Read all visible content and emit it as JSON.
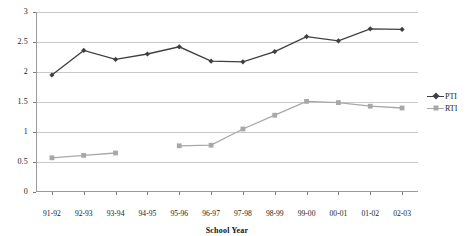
{
  "chart_data": {
    "type": "line",
    "title": "",
    "xlabel": "School Year",
    "ylabel": "",
    "categories": [
      "91-92",
      "92-93",
      "93-94",
      "94-95",
      "95-96",
      "96-97",
      "97-98",
      "98-99",
      "99-00",
      "00-01",
      "01-02",
      "02-03"
    ],
    "ylim": [
      0,
      3
    ],
    "ytick_labels": [
      "0",
      "0.5",
      "1",
      "1.5",
      "2",
      "2.5",
      "3"
    ],
    "ytick_values": [
      0,
      0.5,
      1,
      1.5,
      2,
      2.5,
      3
    ],
    "grid": true,
    "legend_position": "right",
    "series": [
      {
        "name": "PTI",
        "color": "#3f3f3f",
        "marker": "diamond",
        "values": [
          1.95,
          2.36,
          2.21,
          2.3,
          2.42,
          2.18,
          2.17,
          2.34,
          2.59,
          2.52,
          2.72,
          2.71
        ]
      },
      {
        "name": "RTI",
        "color": "#a8a8a8",
        "marker": "square",
        "values": [
          0.57,
          0.61,
          0.65,
          null,
          0.77,
          0.78,
          1.05,
          1.28,
          1.51,
          1.49,
          1.43,
          1.4
        ]
      }
    ]
  },
  "legend": {
    "entries": [
      {
        "label": "PTI"
      },
      {
        "label": "RTI"
      }
    ]
  }
}
